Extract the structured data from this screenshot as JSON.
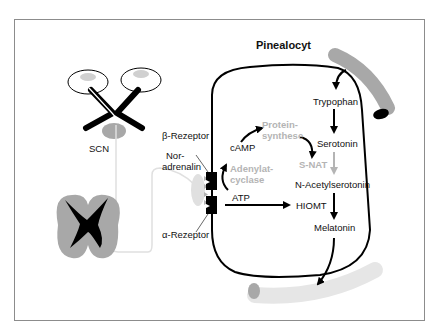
{
  "diagram": {
    "title": "Pinealocyt",
    "labels": {
      "scn": "SCN",
      "beta_receptor": "β-Rezeptor",
      "noradrenalin_1": "Nor-",
      "noradrenalin_2": "adrenalin",
      "alpha_receptor": "α-Rezeptor",
      "camp": "cAMP",
      "atp": "ATP",
      "adenylatcyclase_1": "Adenylat-",
      "adenylatcyclase_2": "cyclase",
      "proteinsynthese_1": "Protein-",
      "proteinsynthese_2": "synthese",
      "tryptophan": "Trypophan",
      "serotonin": "Serotonin",
      "snat": "S-NAT",
      "n_acetylserotonin": "N-Acetylserotonin",
      "hiomt": "HIOMT",
      "melatonin": "Melatonin"
    },
    "colors": {
      "frame": "#8c8c8c",
      "line": "#000000",
      "gray_fill": "#a8a8a8",
      "light_gray": "#dcdcdc",
      "enzyme_text": "#b4b4b4"
    },
    "pathway": [
      "Trypophan",
      "Serotonin",
      "N-Acetylserotonin",
      "Melatonin"
    ]
  }
}
